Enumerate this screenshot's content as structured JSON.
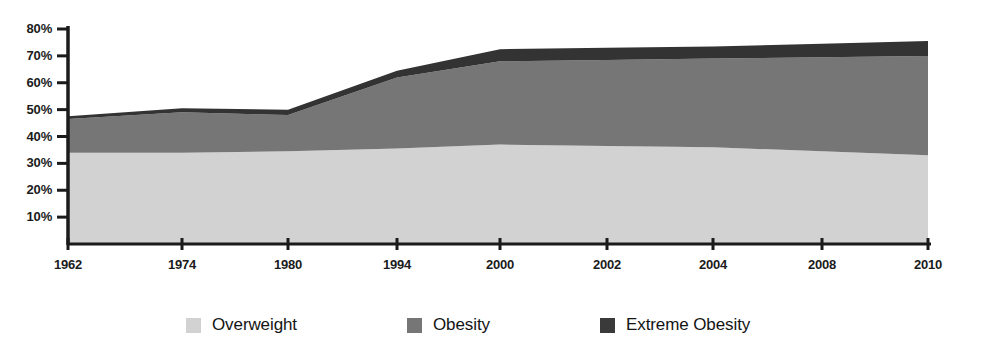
{
  "chart_data": {
    "type": "area",
    "stacked": true,
    "title": "",
    "subtitle": "",
    "xlabel": "",
    "ylabel": "",
    "grid": false,
    "legend_position": "bottom",
    "x": [
      1962,
      1974,
      1980,
      1994,
      2000,
      2002,
      2004,
      2008,
      2010
    ],
    "xtick_labels": [
      "1962",
      "1974",
      "1980",
      "1994",
      "2000",
      "2002",
      "2004",
      "2008",
      "2010"
    ],
    "ytick_labels": [
      "80%",
      "70%",
      "60%",
      "50%",
      "40%",
      "30%",
      "20%",
      "10%"
    ],
    "ytick_values": [
      80,
      70,
      60,
      50,
      40,
      30,
      20,
      10
    ],
    "ylim": [
      0,
      84
    ],
    "xlim": [
      1962,
      2010
    ],
    "series": [
      {
        "name": "Overweight",
        "color": "#d2d2d2",
        "values": [
          34.0,
          34.0,
          34.5,
          35.5,
          37.0,
          36.5,
          36.0,
          34.5,
          33.0
        ]
      },
      {
        "name": "Obesity",
        "color": "#767676",
        "values": [
          12.5,
          15.0,
          13.5,
          26.5,
          31.0,
          32.0,
          33.0,
          35.0,
          37.0
        ]
      },
      {
        "name": "Extreme Obesity",
        "color": "#333333",
        "values": [
          1.0,
          1.5,
          2.0,
          2.5,
          4.5,
          4.5,
          4.5,
          5.0,
          5.5
        ]
      }
    ],
    "cumulative_totals": [
      47.5,
      50.5,
      50.0,
      64.5,
      72.5,
      73.0,
      73.5,
      74.5,
      75.5
    ]
  },
  "legend": {
    "items": [
      {
        "label": "Overweight",
        "color": "#d2d2d2"
      },
      {
        "label": "Obesity",
        "color": "#767676"
      },
      {
        "label": "Extreme Obesity",
        "color": "#3a3a3a"
      }
    ]
  },
  "axis": {
    "axis_color": "#1b1b1b"
  }
}
